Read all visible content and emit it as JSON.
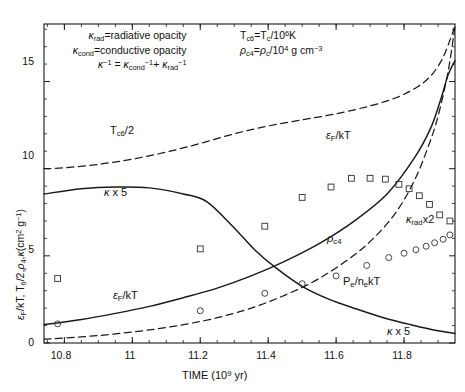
{
  "chart_data": {
    "type": "line",
    "title": "",
    "xlabel": "TIME (10^9 yr)",
    "ylabel": "e_F/kT, T_6/2, rho_4, kappa(cm^2 g^-1)",
    "xlim": [
      10.74,
      11.95
    ],
    "ylim": [
      0,
      18.3
    ],
    "xticks": [
      10.8,
      11,
      11.2,
      11.4,
      11.6,
      11.8
    ],
    "xticklabels": [
      "10.8",
      "11",
      "11.2",
      "11.4",
      "11.6",
      "11.8"
    ],
    "yticks": [
      0,
      5,
      10,
      15
    ],
    "yticklabels": [
      "0",
      "5",
      "10",
      "15"
    ],
    "grid": false,
    "legend_position": "inline-annotations",
    "series": [
      {
        "name": "T_c6/2",
        "style": "dashed",
        "x": [
          10.74,
          10.8,
          10.9,
          11.0,
          11.1,
          11.2,
          11.3,
          11.4,
          11.5,
          11.6,
          11.7,
          11.78,
          11.84,
          11.88,
          11.91,
          11.93,
          11.95
        ],
        "y": [
          10.0,
          10.05,
          10.25,
          10.55,
          10.95,
          11.45,
          12.0,
          12.45,
          12.8,
          13.15,
          13.6,
          14.1,
          14.7,
          15.35,
          16.2,
          17.1,
          18.2
        ]
      },
      {
        "name": "kappa x 5",
        "style": "solid",
        "x": [
          10.74,
          10.85,
          10.95,
          11.05,
          11.15,
          11.22,
          11.3,
          11.36,
          11.42,
          11.5,
          11.58,
          11.66,
          11.74,
          11.82,
          11.9,
          11.95
        ],
        "y": [
          8.55,
          8.85,
          8.95,
          8.9,
          8.55,
          8.1,
          6.6,
          5.35,
          4.35,
          3.25,
          2.5,
          1.95,
          1.45,
          1.05,
          0.7,
          0.55
        ]
      },
      {
        "name": "e_F/kT",
        "style": "solid",
        "x": [
          10.74,
          10.85,
          10.95,
          11.05,
          11.15,
          11.25,
          11.35,
          11.45,
          11.55,
          11.65,
          11.75,
          11.83,
          11.88,
          11.91,
          11.93,
          11.95
        ],
        "y": [
          1.05,
          1.35,
          1.7,
          2.1,
          2.6,
          3.15,
          3.85,
          4.7,
          5.7,
          6.95,
          8.55,
          10.6,
          12.4,
          14.1,
          15.4,
          16.2
        ]
      },
      {
        "name": "rho_c4 / kappa_rad x2",
        "style": "dashed",
        "x": [
          10.74,
          10.85,
          10.95,
          11.05,
          11.15,
          11.25,
          11.35,
          11.45,
          11.55,
          11.65,
          11.72,
          11.78,
          11.83,
          11.87,
          11.9,
          11.93,
          11.95
        ],
        "y": [
          0.22,
          0.35,
          0.52,
          0.75,
          1.05,
          1.45,
          2.0,
          2.75,
          3.7,
          5.0,
          6.2,
          7.6,
          9.3,
          11.2,
          13.0,
          15.6,
          18.2
        ]
      }
    ],
    "scatter": [
      {
        "name": "e_F/kT data",
        "marker": "square",
        "x": [
          10.78,
          11.2,
          11.39,
          11.5,
          11.585,
          11.645,
          11.7,
          11.745,
          11.785,
          11.815,
          11.845,
          11.875,
          11.905,
          11.935
        ],
        "y": [
          3.7,
          5.4,
          6.7,
          8.35,
          8.95,
          9.45,
          9.45,
          9.4,
          9.1,
          8.85,
          8.45,
          7.95,
          7.35,
          7.0
        ]
      },
      {
        "name": "P_e/n_ekT data",
        "marker": "circle",
        "x": [
          10.78,
          11.2,
          11.39,
          11.5,
          11.6,
          11.69,
          11.755,
          11.8,
          11.835,
          11.865,
          11.89,
          11.915,
          11.935
        ],
        "y": [
          1.1,
          1.85,
          2.85,
          3.4,
          3.85,
          4.45,
          4.9,
          5.15,
          5.35,
          5.55,
          5.75,
          5.95,
          6.2
        ]
      }
    ],
    "annotations": [
      {
        "id": "opacity-note-line1",
        "text": "κrad=radiative opacity"
      },
      {
        "id": "opacity-note-line2",
        "text": "κcond=conductive opacity"
      },
      {
        "id": "opacity-note-line3",
        "text": "κ⁻¹ = κcond⁻¹+ κrad⁻¹"
      },
      {
        "id": "defs-note-line1",
        "text": "Tc6=Tc/10⁶K"
      },
      {
        "id": "defs-note-line2",
        "text": "ρc4=ρc/10⁴ g cm⁻³"
      },
      {
        "id": "curve-label-tc6",
        "text": "Tc6/2"
      },
      {
        "id": "curve-label-kappa-left",
        "text": "κ x 5"
      },
      {
        "id": "curve-label-kappa-right",
        "text": "κ x 5"
      },
      {
        "id": "curve-label-ef-left",
        "text": "εF/kT"
      },
      {
        "id": "curve-label-ef-right",
        "text": "εF/kT"
      },
      {
        "id": "curve-label-rho",
        "text": "ρc4"
      },
      {
        "id": "curve-label-krad",
        "text": "κrad x2"
      },
      {
        "id": "curve-label-pe",
        "text": "Pe/nekT"
      }
    ]
  },
  "axes": {
    "x_title_main": "TIME (10",
    "x_title_exp": "9",
    "x_title_unit": " yr)"
  },
  "colors": {
    "axis": "#1a1a1a",
    "curve": "#1a1a1a",
    "marker": "#3a3a3a",
    "background": "#ffffff"
  }
}
